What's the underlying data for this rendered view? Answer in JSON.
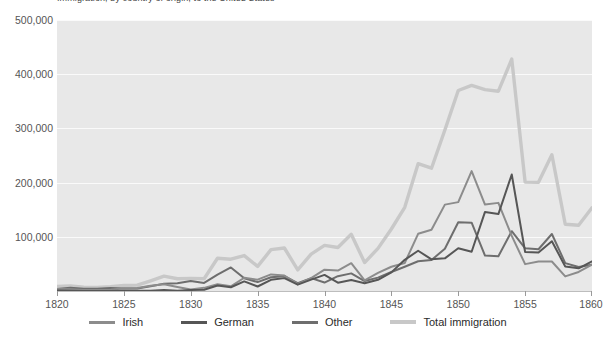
{
  "chart_data": {
    "type": "line",
    "title": "Immigration, by country of origin, to the United States",
    "xlabel": "",
    "ylabel": "",
    "xlim": [
      1820,
      1860
    ],
    "ylim": [
      0,
      500000
    ],
    "xticks": [
      1820,
      1825,
      1830,
      1835,
      1840,
      1845,
      1850,
      1855,
      1860
    ],
    "yticks": [
      100000,
      200000,
      300000,
      400000,
      500000
    ],
    "ytick_labels": [
      "100,000",
      "200,000",
      "300,000",
      "400,000",
      "500,000"
    ],
    "grid": true,
    "legend_position": "bottom",
    "x": [
      1820,
      1821,
      1822,
      1823,
      1824,
      1825,
      1826,
      1827,
      1828,
      1829,
      1830,
      1831,
      1832,
      1833,
      1834,
      1835,
      1836,
      1837,
      1838,
      1839,
      1840,
      1841,
      1842,
      1843,
      1844,
      1845,
      1846,
      1847,
      1848,
      1849,
      1850,
      1851,
      1852,
      1853,
      1854,
      1855,
      1856,
      1857,
      1858,
      1859,
      1860
    ],
    "series": [
      {
        "name": "Irish",
        "color": "#8c8c8c",
        "values": [
          3614,
          3000,
          2000,
          1900,
          2300,
          4900,
          5400,
          9800,
          12500,
          7400,
          2700,
          5800,
          12400,
          8600,
          24500,
          20900,
          30600,
          28500,
          12600,
          23900,
          39400,
          37700,
          51300,
          19600,
          33400,
          44800,
          51700,
          105500,
          112900,
          159400,
          164000,
          221300,
          159500,
          162600,
          101600,
          49600,
          54300,
          54400,
          26900,
          35100,
          48600
        ]
      },
      {
        "name": "German",
        "color": "#565656",
        "values": [
          968,
          383,
          148,
          183,
          230,
          450,
          511,
          432,
          1851,
          597,
          1976,
          2413,
          10194,
          6988,
          17686,
          8311,
          20707,
          23740,
          11683,
          21028,
          29704,
          15291,
          20370,
          14441,
          20731,
          34355,
          57561,
          74281,
          58465,
          60235,
          78896,
          72482,
          145918,
          141946,
          215009,
          71918,
          71028,
          91781,
          45310,
          41784,
          54491
        ]
      },
      {
        "name": "Other",
        "color": "#6e6e6e",
        "values": [
          3896,
          6051,
          4147,
          4329,
          5377,
          4733,
          4423,
          8617,
          13288,
          14312,
          18638,
          14862,
          30260,
          43426,
          23511,
          16416,
          25268,
          27326,
          14369,
          23681,
          15560,
          27316,
          32485,
          18417,
          24654,
          35129,
          44726,
          54879,
          57250,
          77824,
          126953,
          126031,
          65383,
          64174,
          110378,
          78845,
          76974,
          105188,
          51420,
          44126,
          48545
        ]
      },
      {
        "name": "Total immigration",
        "color": "#c8c8c8",
        "values": [
          8385,
          9127,
          6911,
          6354,
          7912,
          10199,
          10837,
          18875,
          27382,
          22520,
          23322,
          22633,
          60482,
          58640,
          65365,
          45374,
          76242,
          79340,
          38914,
          68069,
          84066,
          80289,
          104565,
          52496,
          78615,
          114371,
          154416,
          234968,
          226527,
          297024,
          369980,
          379466,
          371603,
          368645,
          427833,
          200877,
          200436,
          251306,
          123126,
          121282,
          153640
        ]
      }
    ]
  },
  "legend": {
    "items": [
      {
        "label": "Irish",
        "swatch_name": "legend-swatch-irish",
        "color": "#8c8c8c"
      },
      {
        "label": "German",
        "swatch_name": "legend-swatch-german",
        "color": "#565656"
      },
      {
        "label": "Other",
        "swatch_name": "legend-swatch-other",
        "color": "#6e6e6e"
      },
      {
        "label": "Total immigration",
        "swatch_name": "legend-swatch-total",
        "color": "#c8c8c8"
      }
    ]
  },
  "theme": {
    "plot_background": "#e8e8e8",
    "page_background": "#ffffff",
    "gridline_color": "#fafafa",
    "axis_text_color": "#555555",
    "legend_text_color": "#2b2b2b"
  }
}
